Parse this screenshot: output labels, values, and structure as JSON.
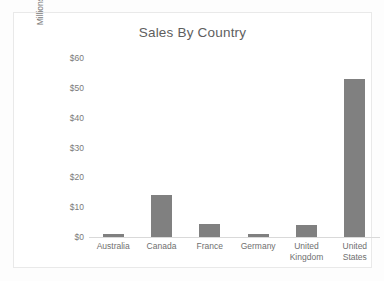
{
  "chart_data": {
    "type": "bar",
    "title": "Sales By Country",
    "xlabel": "",
    "ylabel": "Millions",
    "categories": [
      "Australia",
      "Canada",
      "France",
      "Germany",
      "United Kingdom",
      "United States"
    ],
    "values": [
      1,
      14,
      4.5,
      1,
      4,
      53
    ],
    "ylim": [
      0,
      60
    ],
    "ytick_values": [
      0,
      10,
      20,
      30,
      40,
      50,
      60
    ],
    "ytick_labels": [
      "$0",
      "$10",
      "$20",
      "$30",
      "$40",
      "$50",
      "$60"
    ],
    "grid": false,
    "legend": null,
    "series": [
      {
        "name": "Sales",
        "values": [
          1,
          14,
          4.5,
          1,
          4,
          53
        ],
        "color": "#808080"
      }
    ]
  },
  "style": {
    "bar_color": "#808080",
    "text_color": "#7a7a7a",
    "title_color": "#5e5e5e",
    "axis_line_color": "#d9d9d9",
    "frame_border_color": "#e9e9e9",
    "background": "#ffffff"
  }
}
